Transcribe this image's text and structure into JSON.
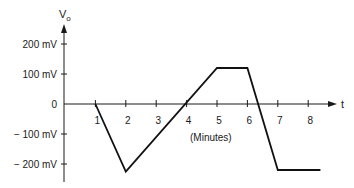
{
  "chart_data": {
    "type": "line",
    "title": "",
    "ylabel": "V",
    "ylabel_subscript": "o",
    "xlabel": "t",
    "xunit_label": "(Minutes)",
    "xlim": [
      0,
      8.9
    ],
    "ylim": [
      -230,
      230
    ],
    "x_ticks": [
      1,
      2,
      3,
      4,
      5,
      6,
      7,
      8
    ],
    "x_tick_labels": [
      "1",
      "2",
      "3",
      "4",
      "5",
      "6",
      "7",
      "8"
    ],
    "y_ticks": [
      200,
      100,
      0,
      -100,
      -200
    ],
    "y_tick_labels": [
      "200 mV",
      "100 mV",
      "0",
      "− 100 mV",
      "− 200 mV"
    ],
    "grid": false,
    "legend": "none",
    "series": [
      {
        "name": "Vo",
        "x": [
          1.0,
          2.0,
          5.0,
          6.0,
          7.0,
          8.4
        ],
        "y": [
          0,
          -225,
          120,
          120,
          -220,
          -220
        ]
      }
    ]
  }
}
